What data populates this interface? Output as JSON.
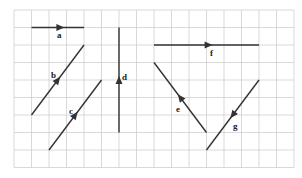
{
  "grid": {
    "origin_x": 14,
    "origin_y": 10,
    "cell": 17.5,
    "cols": 16,
    "rows": 9,
    "line_color": "#cfcfcf"
  },
  "colors": {
    "vector": "#333333"
  },
  "vectors": [
    {
      "name": "a",
      "from": [
        1,
        1
      ],
      "to": [
        4,
        1
      ],
      "arrow_t": 0.55,
      "label_pos": [
        57,
        38
      ]
    },
    {
      "name": "b",
      "from": [
        1,
        6
      ],
      "to": [
        4,
        2
      ],
      "arrow_t": 0.5,
      "label_pos": [
        51,
        78
      ]
    },
    {
      "name": "c",
      "from": [
        2,
        8
      ],
      "to": [
        5,
        4
      ],
      "arrow_t": 0.5,
      "label_pos": [
        69,
        114
      ]
    },
    {
      "name": "d",
      "from": [
        6,
        7
      ],
      "to": [
        6,
        1
      ],
      "arrow_t": 0.5,
      "label_pos": [
        122,
        80
      ]
    },
    {
      "name": "f",
      "from": [
        8,
        2
      ],
      "to": [
        14,
        2
      ],
      "arrow_t": 0.52,
      "label_pos": [
        210,
        56
      ]
    },
    {
      "name": "e",
      "from": [
        11,
        7
      ],
      "to": [
        8,
        3
      ],
      "arrow_t": 0.5,
      "label_pos": [
        176,
        112
      ]
    },
    {
      "name": "g",
      "from": [
        14,
        4
      ],
      "to": [
        11,
        8
      ],
      "arrow_t": 0.5,
      "label_pos": [
        233,
        129
      ]
    }
  ]
}
